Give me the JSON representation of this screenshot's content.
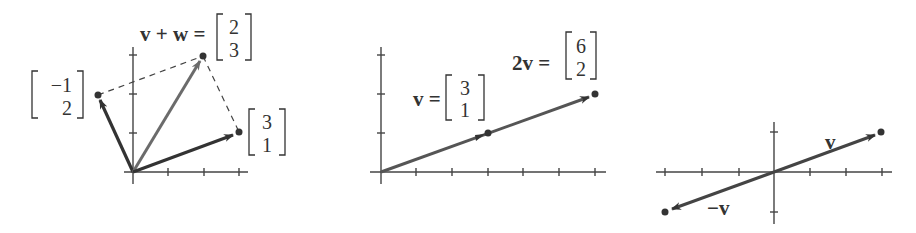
{
  "panels": [
    {
      "id": "vector-addition",
      "label_sum": "v + w =",
      "sum_vector": [
        "2",
        "3"
      ],
      "w_vector": [
        "−1",
        "2"
      ],
      "v_vector": [
        "3",
        "1"
      ]
    },
    {
      "id": "scalar-multiple",
      "label_v": "v =",
      "v_vector": [
        "3",
        "1"
      ],
      "label_2v": "2v =",
      "two_v_vector": [
        "6",
        "2"
      ]
    },
    {
      "id": "negation",
      "label_v": "v",
      "label_neg_v": "−v"
    }
  ],
  "colors": {
    "dark_arrow": "#333333",
    "light_arrow": "#6b6b6b",
    "axis": "#444444"
  }
}
